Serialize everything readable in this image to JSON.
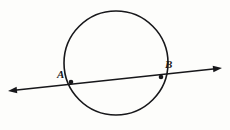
{
  "figure": {
    "kind": "geometry-diagram",
    "background_color": "#fdfdfb",
    "stroke_color": "#17171a",
    "width": 230,
    "height": 130
  },
  "circle": {
    "name": "circle",
    "center_x": 116,
    "center_y": 63,
    "radius": 52,
    "stroke_width": 1.6,
    "fill": "none"
  },
  "secant": {
    "name": "secant-line",
    "start_x": 8,
    "start_y": 91,
    "end_x": 222,
    "end_y": 68,
    "stroke_width": 1.6,
    "arrow_start": true,
    "arrow_end": true
  },
  "points": [
    {
      "id": "a",
      "label": "A",
      "x": 71,
      "y": 82,
      "dot_radius": 2.3,
      "label_x": 57,
      "label_y": 69
    },
    {
      "id": "b",
      "label": "B",
      "x": 161,
      "y": 77,
      "dot_radius": 2.3,
      "label_x": 165,
      "label_y": 59
    }
  ]
}
